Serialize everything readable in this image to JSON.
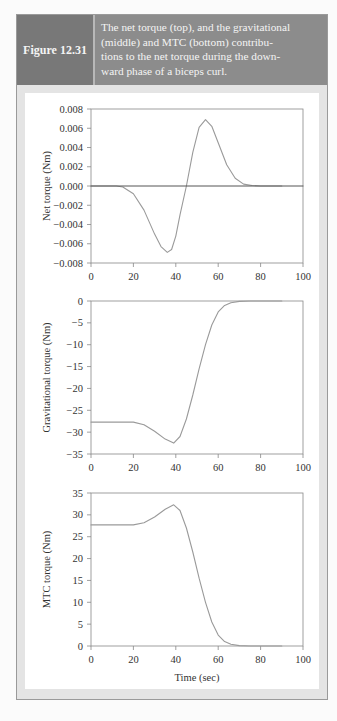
{
  "figure": {
    "number": "Figure 12.31",
    "caption": "The net torque (top), and the gravitational (middle) and MTC (bottom) contributions to the net torque during the downward phase of a biceps curl.",
    "caption_lines": [
      "The net torque (top), and the gravitational",
      "(middle) and MTC (bottom) contribu-",
      "tions to the net torque during the down-",
      "ward phase of a biceps curl."
    ]
  },
  "colors": {
    "label_bg": "#787878",
    "title_bg": "#8c8c8c",
    "curve": "#9a9a9a",
    "zero_line": "#555555",
    "axis": "#888888"
  },
  "chart_data": [
    {
      "type": "line",
      "title": "Net torque",
      "xlabel": "",
      "ylabel": "Net torque (Nm)",
      "xlim": [
        0,
        100
      ],
      "ylim": [
        -0.008,
        0.008
      ],
      "xticks": [
        "0",
        "20",
        "40",
        "60",
        "80",
        "100"
      ],
      "yticks": [
        "0.008",
        "0.006",
        "0.004",
        "0.002",
        "0.000",
        "−0.002",
        "−0.004",
        "−0.006",
        "−0.008"
      ],
      "grid": false,
      "series": [
        {
          "name": "Net torque",
          "x": [
            0,
            12,
            15,
            20,
            25,
            30,
            33,
            36,
            38,
            40,
            42,
            45,
            48,
            51,
            54,
            57,
            60,
            64,
            68,
            72,
            76,
            80,
            90
          ],
          "y": [
            0,
            0,
            -0.0001,
            -0.0008,
            -0.0025,
            -0.005,
            -0.0063,
            -0.0069,
            -0.0066,
            -0.0052,
            -0.003,
            0,
            0.0035,
            0.0061,
            0.0069,
            0.0062,
            0.0045,
            0.0022,
            0.0008,
            0.0002,
            5e-05,
            0,
            0
          ]
        },
        {
          "name": "Zero line",
          "x": [
            0,
            100
          ],
          "y": [
            0,
            0
          ]
        }
      ]
    },
    {
      "type": "line",
      "title": "Gravitational torque",
      "xlabel": "",
      "ylabel": "Gravitational torque (Nm)",
      "xlim": [
        0,
        100
      ],
      "ylim": [
        -35,
        0
      ],
      "xticks": [
        "0",
        "20",
        "40",
        "60",
        "80",
        "100"
      ],
      "yticks": [
        "0",
        "−5",
        "−10",
        "−15",
        "−20",
        "−25",
        "−30",
        "−35"
      ],
      "grid": false,
      "series": [
        {
          "name": "Gravitational torque",
          "x": [
            0,
            20,
            25,
            30,
            35,
            39,
            42,
            45,
            48,
            51,
            54,
            57,
            60,
            63,
            66,
            70,
            75,
            80,
            90
          ],
          "y": [
            -27.7,
            -27.7,
            -28.3,
            -29.8,
            -31.6,
            -32.5,
            -31.0,
            -27.0,
            -21.5,
            -15.5,
            -10.0,
            -5.5,
            -2.5,
            -1.0,
            -0.4,
            -0.1,
            0,
            0,
            0
          ]
        }
      ]
    },
    {
      "type": "line",
      "title": "MTC torque",
      "xlabel": "Time (sec)",
      "ylabel": "MTC torque (Nm)",
      "xlim": [
        0,
        100
      ],
      "ylim": [
        0,
        35
      ],
      "xticks": [
        "0",
        "20",
        "40",
        "60",
        "80",
        "100"
      ],
      "yticks": [
        "35",
        "30",
        "25",
        "20",
        "15",
        "10",
        "5",
        "0"
      ],
      "grid": false,
      "series": [
        {
          "name": "MTC torque",
          "x": [
            0,
            20,
            25,
            30,
            35,
            39,
            42,
            45,
            48,
            51,
            54,
            57,
            60,
            63,
            66,
            70,
            75,
            80,
            90
          ],
          "y": [
            27.7,
            27.7,
            28.2,
            29.5,
            31.3,
            32.3,
            31.0,
            27.0,
            21.5,
            15.5,
            10.0,
            5.5,
            2.5,
            1.0,
            0.4,
            0.1,
            0,
            0,
            0
          ]
        }
      ]
    }
  ]
}
